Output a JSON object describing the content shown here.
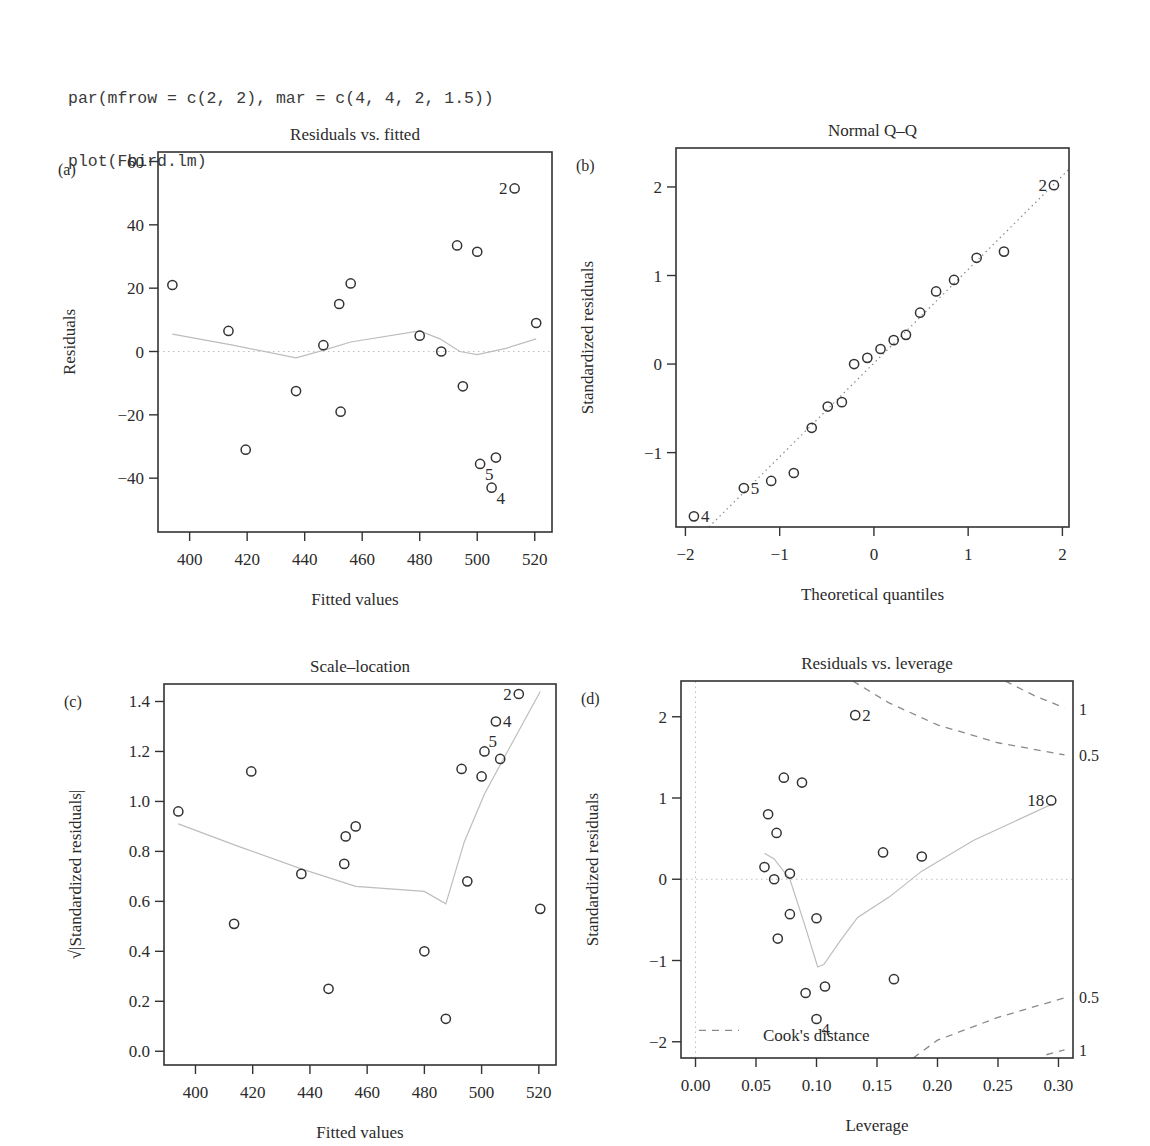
{
  "code": {
    "lines": [
      "par(mfrow = c(2, 2), mar = c(4, 4, 2, 1.5))",
      "plot(Fbird.lm)"
    ]
  },
  "chart_data": [
    {
      "id": "a",
      "panel_label": "(a)",
      "type": "scatter",
      "title": "Residuals vs. fitted",
      "xlabel": "Fitted values",
      "ylabel": "Residuals",
      "xlim": [
        389,
        526
      ],
      "ylim": [
        -57,
        63
      ],
      "xticks": [
        400,
        420,
        440,
        460,
        480,
        500,
        520
      ],
      "yticks": [
        -40,
        -20,
        0,
        20,
        40,
        60
      ],
      "frame": {
        "left": 158,
        "top": 152,
        "right": 552,
        "bottom": 532
      },
      "reference_line": {
        "y": 0,
        "style": "dotted"
      },
      "points": [
        {
          "x": 394,
          "y": 21
        },
        {
          "x": 413.5,
          "y": 6.5
        },
        {
          "x": 419.5,
          "y": -31
        },
        {
          "x": 437,
          "y": -12.5
        },
        {
          "x": 446.5,
          "y": 2
        },
        {
          "x": 452,
          "y": 15
        },
        {
          "x": 452.5,
          "y": -19
        },
        {
          "x": 456,
          "y": 21.5
        },
        {
          "x": 480,
          "y": 5
        },
        {
          "x": 487.5,
          "y": 0
        },
        {
          "x": 493,
          "y": 33.5
        },
        {
          "x": 495,
          "y": -11
        },
        {
          "x": 500,
          "y": 31.5
        },
        {
          "x": 501,
          "y": -35.5
        },
        {
          "x": 505,
          "y": -43
        },
        {
          "x": 506.5,
          "y": -33.5
        },
        {
          "x": 513,
          "y": 51.5
        },
        {
          "x": 520.5,
          "y": 9
        }
      ],
      "labels": [
        {
          "text": "2",
          "x": 513,
          "y": 51.5,
          "pos": "left"
        },
        {
          "text": "5",
          "x": 501,
          "y": -35.5,
          "pos": "below-right"
        },
        {
          "text": "4",
          "x": 505,
          "y": -43,
          "pos": "below-right"
        }
      ],
      "smooth": [
        [
          394,
          5.5
        ],
        [
          415,
          2
        ],
        [
          437,
          -2
        ],
        [
          447,
          0.5
        ],
        [
          456,
          3
        ],
        [
          480,
          6.5
        ],
        [
          487,
          4
        ],
        [
          494,
          0
        ],
        [
          500,
          -1
        ],
        [
          510,
          1
        ],
        [
          520.5,
          4
        ]
      ]
    },
    {
      "id": "b",
      "panel_label": "(b)",
      "type": "scatter",
      "title": "Normal Q–Q",
      "xlabel": "Theoretical quantiles",
      "ylabel": "Standardized residuals",
      "xlim": [
        -2.1,
        2.07
      ],
      "ylim": [
        -1.84,
        2.44
      ],
      "xticks": [
        -2,
        -1,
        0,
        1,
        2
      ],
      "yticks": [
        -1,
        0,
        1,
        2
      ],
      "frame": {
        "left": 676,
        "top": 148,
        "right": 1069,
        "bottom": 527
      },
      "qq_line": [
        [
          -1.75,
          -1.84
        ],
        [
          2.07,
          2.2
        ]
      ],
      "points": [
        {
          "x": -1.91,
          "y": -1.72
        },
        {
          "x": -1.38,
          "y": -1.4
        },
        {
          "x": -1.09,
          "y": -1.32
        },
        {
          "x": -0.85,
          "y": -1.23
        },
        {
          "x": -0.66,
          "y": -0.72
        },
        {
          "x": -0.49,
          "y": -0.48
        },
        {
          "x": -0.34,
          "y": -0.43
        },
        {
          "x": -0.21,
          "y": 0.0
        },
        {
          "x": -0.07,
          "y": 0.07
        },
        {
          "x": 0.07,
          "y": 0.17
        },
        {
          "x": 0.21,
          "y": 0.27
        },
        {
          "x": 0.34,
          "y": 0.33
        },
        {
          "x": 0.49,
          "y": 0.58
        },
        {
          "x": 0.66,
          "y": 0.82
        },
        {
          "x": 0.85,
          "y": 0.95
        },
        {
          "x": 1.09,
          "y": 1.2
        },
        {
          "x": 1.38,
          "y": 1.27
        },
        {
          "x": 1.91,
          "y": 2.02
        }
      ],
      "labels": [
        {
          "text": "2",
          "x": 1.91,
          "y": 2.02,
          "pos": "left"
        },
        {
          "text": "5",
          "x": -1.38,
          "y": -1.4,
          "pos": "right"
        },
        {
          "text": "4",
          "x": -1.91,
          "y": -1.72,
          "pos": "right"
        }
      ]
    },
    {
      "id": "c",
      "panel_label": "(c)",
      "type": "scatter",
      "title": "Scale–location",
      "xlabel": "Fitted values",
      "ylabel": "√|Standardized residuals|",
      "xlim": [
        389,
        526
      ],
      "ylim": [
        -0.055,
        1.47
      ],
      "xticks": [
        400,
        420,
        440,
        460,
        480,
        500,
        520
      ],
      "yticks": [
        0.0,
        0.2,
        0.4,
        0.6,
        0.8,
        1.0,
        1.2,
        1.4
      ],
      "ytick_labels": [
        "0.0",
        "0.2",
        "0.4",
        "0.6",
        "0.8",
        "1.0",
        "1.2",
        "1.4"
      ],
      "frame": {
        "left": 164,
        "top": 684,
        "right": 556,
        "bottom": 1065
      },
      "points": [
        {
          "x": 394,
          "y": 0.96
        },
        {
          "x": 413.5,
          "y": 0.51
        },
        {
          "x": 419.5,
          "y": 1.12
        },
        {
          "x": 437,
          "y": 0.71
        },
        {
          "x": 446.5,
          "y": 0.25
        },
        {
          "x": 452,
          "y": 0.75
        },
        {
          "x": 452.5,
          "y": 0.86
        },
        {
          "x": 456,
          "y": 0.9
        },
        {
          "x": 480,
          "y": 0.4
        },
        {
          "x": 487.5,
          "y": 0.13
        },
        {
          "x": 493,
          "y": 1.13
        },
        {
          "x": 495,
          "y": 0.68
        },
        {
          "x": 500,
          "y": 1.1
        },
        {
          "x": 501,
          "y": 1.2
        },
        {
          "x": 505,
          "y": 1.32
        },
        {
          "x": 506.5,
          "y": 1.17
        },
        {
          "x": 513,
          "y": 1.43
        },
        {
          "x": 520.5,
          "y": 0.57
        }
      ],
      "labels": [
        {
          "text": "2",
          "x": 513,
          "y": 1.43,
          "pos": "left"
        },
        {
          "text": "4",
          "x": 505,
          "y": 1.32,
          "pos": "right"
        },
        {
          "text": "5",
          "x": 501,
          "y": 1.2,
          "pos": "above-right"
        }
      ],
      "smooth": [
        [
          394,
          0.91
        ],
        [
          415,
          0.82
        ],
        [
          437,
          0.73
        ],
        [
          456,
          0.66
        ],
        [
          480,
          0.64
        ],
        [
          487.5,
          0.59
        ],
        [
          494,
          0.84
        ],
        [
          501,
          1.03
        ],
        [
          510,
          1.22
        ],
        [
          520.5,
          1.44
        ]
      ]
    },
    {
      "id": "d",
      "panel_label": "(d)",
      "type": "scatter",
      "title": "Residuals vs. leverage",
      "xlabel": "Leverage",
      "ylabel": "Standardized residuals",
      "xlim": [
        -0.012,
        0.312
      ],
      "ylim": [
        -2.2,
        2.44
      ],
      "xticks": [
        0.0,
        0.05,
        0.1,
        0.15,
        0.2,
        0.25,
        0.3
      ],
      "xtick_labels": [
        "0.00",
        "0.05",
        "0.10",
        "0.15",
        "0.20",
        "0.25",
        "0.30"
      ],
      "yticks": [
        -2,
        -1,
        0,
        1,
        2
      ],
      "frame": {
        "left": 681,
        "top": 681,
        "right": 1073,
        "bottom": 1058
      },
      "reference_lines": [
        {
          "y": 0,
          "style": "dotted"
        },
        {
          "x": 0,
          "style": "dotted"
        }
      ],
      "points": [
        {
          "x": 0.057,
          "y": 0.15
        },
        {
          "x": 0.06,
          "y": 0.8
        },
        {
          "x": 0.065,
          "y": 0.0
        },
        {
          "x": 0.067,
          "y": 0.57
        },
        {
          "x": 0.068,
          "y": -0.73
        },
        {
          "x": 0.073,
          "y": 1.25
        },
        {
          "x": 0.078,
          "y": 0.07
        },
        {
          "x": 0.078,
          "y": -0.43
        },
        {
          "x": 0.088,
          "y": 1.19
        },
        {
          "x": 0.091,
          "y": -1.4
        },
        {
          "x": 0.1,
          "y": -0.48
        },
        {
          "x": 0.1,
          "y": -1.72
        },
        {
          "x": 0.107,
          "y": -1.32
        },
        {
          "x": 0.132,
          "y": 2.02
        },
        {
          "x": 0.155,
          "y": 0.33
        },
        {
          "x": 0.164,
          "y": -1.23
        },
        {
          "x": 0.187,
          "y": 0.28
        },
        {
          "x": 0.294,
          "y": 0.97
        }
      ],
      "labels": [
        {
          "text": "2",
          "x": 0.132,
          "y": 2.02,
          "pos": "right"
        },
        {
          "text": "4",
          "x": 0.1,
          "y": -1.72,
          "pos": "below-right"
        },
        {
          "text": "18",
          "x": 0.294,
          "y": 0.97,
          "pos": "left"
        }
      ],
      "smooth": [
        [
          0.057,
          0.32
        ],
        [
          0.065,
          0.25
        ],
        [
          0.078,
          0.0
        ],
        [
          0.09,
          -0.55
        ],
        [
          0.101,
          -1.08
        ],
        [
          0.106,
          -1.05
        ],
        [
          0.12,
          -0.75
        ],
        [
          0.134,
          -0.47
        ],
        [
          0.16,
          -0.22
        ],
        [
          0.187,
          0.1
        ],
        [
          0.23,
          0.48
        ],
        [
          0.294,
          0.92
        ]
      ],
      "cooks_distance": {
        "legend_label": "Cook's distance",
        "contour_labels": [
          {
            "text": "1",
            "side": "top",
            "y": 2.1
          },
          {
            "text": "0.5",
            "side": "top",
            "y": 1.53
          },
          {
            "text": "0.5",
            "side": "bottom",
            "y": -1.45
          },
          {
            "text": "1",
            "side": "bottom",
            "y": -2.1
          }
        ],
        "curves": [
          {
            "level": 0.5,
            "upper": [
              [
                0.13,
                2.44
              ],
              [
                0.16,
                2.17
              ],
              [
                0.2,
                1.9
              ],
              [
                0.25,
                1.68
              ],
              [
                0.305,
                1.53
              ]
            ],
            "lower": [
              [
                0.18,
                -2.2
              ],
              [
                0.2,
                -1.98
              ],
              [
                0.25,
                -1.7
              ],
              [
                0.305,
                -1.46
              ]
            ]
          },
          {
            "level": 1,
            "upper": [
              [
                0.256,
                2.44
              ],
              [
                0.28,
                2.26
              ],
              [
                0.305,
                2.11
              ]
            ],
            "lower": [
              [
                0.29,
                -2.16
              ],
              [
                0.305,
                -2.1
              ]
            ]
          }
        ]
      }
    }
  ]
}
